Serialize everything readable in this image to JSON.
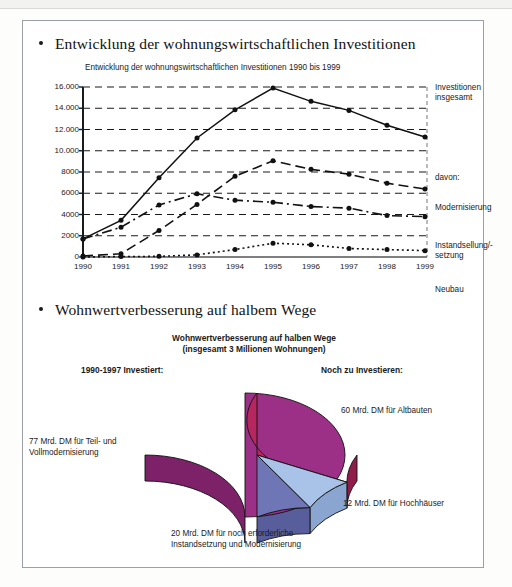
{
  "slide": {
    "bullets": [
      {
        "text": "Entwicklung der wohnungswirtschaftlichen Investitionen"
      },
      {
        "text": "Wohnwertverbesserung auf halbem Wege"
      }
    ]
  },
  "chart_data": [
    {
      "type": "line",
      "title": "Entwicklung der wohnungswirtschaftlichen Investitionen 1990 bis 1999",
      "xlabel": "",
      "ylabel": "",
      "ylim": [
        0,
        16000
      ],
      "yticks": [
        "0",
        "2000",
        "4000",
        "6000",
        "8000",
        "10.000",
        "12.000",
        "14.000",
        "16.000"
      ],
      "ytick_values": [
        0,
        2000,
        4000,
        6000,
        8000,
        10000,
        12000,
        14000,
        16000
      ],
      "grid": true,
      "legend_position": "right",
      "categories": [
        "1990",
        "1991",
        "1992",
        "1993",
        "1994",
        "1995",
        "1996",
        "1997",
        "1998",
        "1999"
      ],
      "series": [
        {
          "name": "Investitionen insgesamt",
          "style": "solid",
          "values": [
            1700,
            3450,
            7450,
            11200,
            13850,
            15900,
            14650,
            13800,
            12400,
            11300
          ]
        },
        {
          "name": "Modernisierung",
          "style": "dashed",
          "values": [
            100,
            300,
            2500,
            4950,
            7600,
            9050,
            8250,
            7800,
            6950,
            6400
          ]
        },
        {
          "name": "Instandsellung/-setzung",
          "style": "dash-dot",
          "values": [
            1700,
            2800,
            4900,
            5950,
            5350,
            5150,
            4750,
            4600,
            3900,
            3800
          ]
        },
        {
          "name": "Neubau",
          "style": "dotted",
          "values": [
            0,
            40,
            60,
            200,
            700,
            1300,
            1150,
            800,
            700,
            600
          ]
        }
      ],
      "legend_groups": [
        {
          "label": "Investitionen\ninsgesamt",
          "line1": "Investitionen",
          "line2": "insgesamt"
        },
        {
          "label": "davon:",
          "line1": "davon:",
          "line2": ""
        },
        {
          "label": "Modernisierung",
          "line1": "Modernisierung",
          "line2": ""
        },
        {
          "label": "Instandsellung/-\nsetzung",
          "line1": "Instandsellung/-",
          "line2": "setzung"
        },
        {
          "label": "Neubau",
          "line1": "Neubau",
          "line2": ""
        }
      ]
    },
    {
      "type": "pie",
      "title_line1": "Wohnwertverbesserung auf halben Wege",
      "title_line2": "(insgesamt 3 Millionen Wohnungen)",
      "left_header": "1990-1997 Investiert:",
      "right_header": "Noch zu Investieren:",
      "unit": "Mrd. DM",
      "total": 169,
      "slices": [
        {
          "label_line1": "77 Mrd. DM für Teil- und",
          "label_line2": "Vollmodernisierung",
          "value": 77,
          "color": "#9c2f86",
          "side_color": "#7d2169"
        },
        {
          "label_line1": "60 Mrd. DM für Altbauten",
          "label_line2": "",
          "value": 60,
          "color": "#b7275f",
          "side_color": "#8f1c4a"
        },
        {
          "label_line1": "12 Mrd. DM für Hochhäuser",
          "label_line2": "",
          "value": 12,
          "color": "#a9c3e8",
          "side_color": "#8aa5cf"
        },
        {
          "label_line1": "20 Mrd. DM für noch erforderliche",
          "label_line2": "Instandsetzung und Modernisierung",
          "value": 20,
          "color": "#6f76b5",
          "side_color": "#575e9b"
        }
      ]
    }
  ]
}
